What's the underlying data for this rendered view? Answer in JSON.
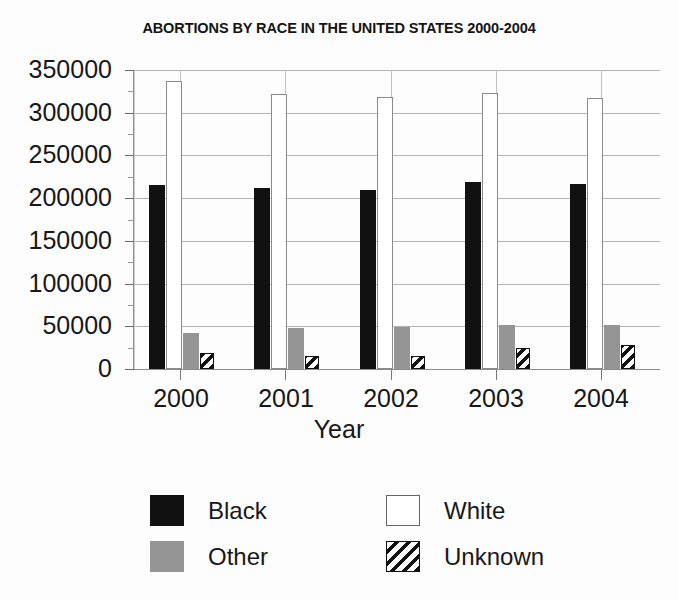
{
  "chart_data": {
    "type": "bar",
    "title": "ABORTIONS BY RACE IN THE UNITED STATES 2000-2004",
    "xlabel": "Year",
    "ylabel": "",
    "categories": [
      "2000",
      "2001",
      "2002",
      "2003",
      "2004"
    ],
    "ylim": [
      0,
      350000
    ],
    "ytick_labels": [
      "0",
      "50000",
      "100000",
      "150000",
      "200000",
      "250000",
      "300000",
      "350000"
    ],
    "ytick_values": [
      0,
      50000,
      100000,
      150000,
      200000,
      250000,
      300000,
      350000
    ],
    "ytick_minor_step": 25000,
    "grid": true,
    "legend_position": "bottom",
    "series": [
      {
        "name": "Black",
        "color": "#111111",
        "fill": "solid",
        "values": [
          215000,
          212000,
          209000,
          219000,
          216000
        ]
      },
      {
        "name": "White",
        "color": "#ffffff",
        "fill": "hollow",
        "values": [
          337000,
          322000,
          318000,
          323000,
          317000
        ]
      },
      {
        "name": "Other",
        "color": "#959595",
        "fill": "solid",
        "values": [
          42000,
          48000,
          49000,
          51000,
          51000
        ]
      },
      {
        "name": "Unknown",
        "color": "#111111",
        "fill": "hatch",
        "values": [
          19000,
          15000,
          15000,
          25000,
          28000
        ]
      }
    ]
  },
  "legend": {
    "items": [
      {
        "label": "Black",
        "swatch": "swatch-black"
      },
      {
        "label": "White",
        "swatch": "swatch-white"
      },
      {
        "label": "Other",
        "swatch": "swatch-other"
      },
      {
        "label": "Unknown",
        "swatch": "swatch-unknown"
      }
    ]
  }
}
